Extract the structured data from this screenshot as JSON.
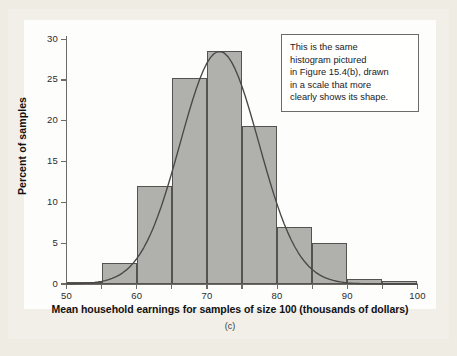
{
  "figure": {
    "panel_caption": "(c)",
    "background_color": "#f1efe8",
    "plot_background_color": "#fdfdfc"
  },
  "annotation": {
    "text": "This is the same histogram pictured in Figure 15.4(b), drawn in a scale that more clearly shows its shape.",
    "lines": [
      "This is the same",
      "histogram pictured",
      "in Figure 15.4(b), drawn",
      "in a scale that more",
      "clearly shows its shape."
    ],
    "border_color": "#6b6b6b",
    "fill_color": "#ffffff"
  },
  "chart_data": {
    "type": "bar",
    "title": "",
    "subtitle": "",
    "xlabel": "Mean household earnings for samples of size 100 (thousands of dollars)",
    "ylabel": "Percent of samples",
    "xlim": [
      50,
      100
    ],
    "ylim": [
      0,
      31
    ],
    "grid": false,
    "legend_position": "none",
    "bar_fill_color": "#b0b0ad",
    "bar_edge_color": "#55534f",
    "curve_color": "#4a4846",
    "bin_width": 5,
    "x_ticks": [
      50,
      55,
      60,
      65,
      70,
      75,
      80,
      85,
      90,
      95,
      100
    ],
    "x_tick_labels": [
      "50",
      "",
      "60",
      "",
      "70",
      "",
      "80",
      "",
      "90",
      "",
      "100"
    ],
    "y_ticks": [
      0,
      5,
      10,
      15,
      20,
      25,
      30
    ],
    "y_tick_labels": [
      "0",
      "5",
      "10",
      "15",
      "20",
      "25",
      "30"
    ],
    "categories": [
      "50-55",
      "55-60",
      "60-65",
      "65-70",
      "70-75",
      "75-80",
      "80-85",
      "85-90",
      "90-95",
      "95-100"
    ],
    "bin_starts": [
      50,
      55,
      60,
      65,
      70,
      75,
      80,
      85,
      90,
      95
    ],
    "values": [
      0.3,
      2.6,
      12.0,
      25.3,
      28.5,
      19.3,
      7.0,
      5.0,
      0.6,
      0.4
    ],
    "overlay_curve": {
      "type": "normal",
      "mean": 71.8,
      "sd": 5.6,
      "peak_value": 28.5,
      "description": "smooth normal density curve overlaid on histogram"
    }
  }
}
